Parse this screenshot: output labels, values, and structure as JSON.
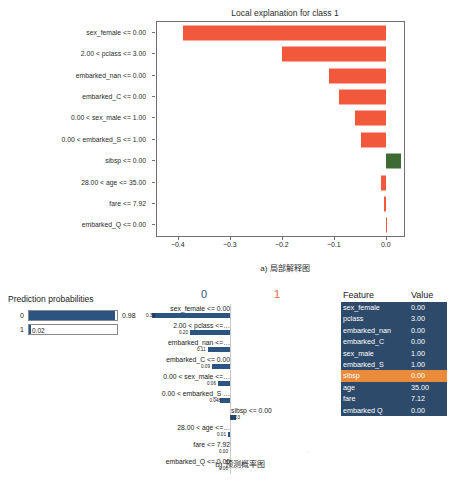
{
  "chart_data": [
    {
      "type": "bar",
      "orientation": "horizontal",
      "title": "Local explanation for class 1",
      "xlabel": "",
      "ylabel": "",
      "xlim": [
        -0.44,
        0.035
      ],
      "xticks": [
        -0.4,
        -0.3,
        -0.2,
        -0.1,
        0.0
      ],
      "xtick_labels": [
        "−0.4",
        "−0.3",
        "−0.2",
        "−0.1",
        "0.0"
      ],
      "grid": false,
      "legend": "none",
      "categories": [
        "sex_female <= 0.00",
        "2.00 < pclass <= 3.00",
        "embarked_nan <= 0.00",
        "embarked_C <= 0.00",
        "0.00 < sex_male <= 1.00",
        "0.00 < embarked_S <= 1.00",
        "sibsp <= 0.00",
        "28.00 < age <= 35.00",
        "fare <= 7.92",
        "embarked_Q <= 0.00"
      ],
      "values": [
        -0.39,
        -0.2,
        -0.11,
        -0.09,
        -0.06,
        -0.048,
        0.03,
        -0.01,
        -0.004,
        -0.0005
      ],
      "colors": {
        "negative": "#f2593c",
        "positive": "#3e6b34"
      },
      "caption": "a) 局部解释图"
    },
    {
      "type": "bar",
      "orientation": "horizontal",
      "title": "",
      "class_labels": [
        "0",
        "1"
      ],
      "class_label_colors": [
        "#2b5481",
        "#e06a4a"
      ],
      "grid": false,
      "legend": "none",
      "categories": [
        "sex_female <= 0.00",
        "2.00 < pclass <=…",
        "embarked_nan <=…",
        "embarked_C <= 0.00",
        "0.00 < sex_male <=…",
        "0.00 < embarked_S …",
        "sibsp <= 0.00",
        "28.00 < age <=…",
        "fare <= 7.92",
        "embarked_Q <= 0.00"
      ],
      "values": [
        0.39,
        0.2,
        0.11,
        0.09,
        0.06,
        0.048,
        0.03,
        0.01,
        0.0,
        0.0
      ],
      "value_labels": [
        "0.39",
        "0.20",
        "0.11",
        "0.09",
        "0.06",
        "0.048",
        "0.03",
        "0.01",
        "0.00",
        "0.00"
      ],
      "side": [
        "left",
        "left",
        "left",
        "left",
        "left",
        "left",
        "right",
        "left",
        "left",
        "left"
      ],
      "color": "#2b5481",
      "caption": "b) 预测概率图"
    }
  ],
  "panel_a": {
    "title": "Local explanation for class 1",
    "caption": "a) 局部解释图",
    "y_labels": [
      "sex_female <= 0.00",
      "2.00 < pclass <= 3.00",
      "embarked_nan <= 0.00",
      "embarked_C <= 0.00",
      "0.00 < sex_male <= 1.00",
      "0.00 < embarked_S <= 1.00",
      "sibsp <= 0.00",
      "28.00 < age <= 35.00",
      "fare <= 7.92",
      "embarked_Q <= 0.00"
    ],
    "x_labels": [
      "−0.4",
      "−0.3",
      "−0.2",
      "−0.1",
      "0.0"
    ]
  },
  "panel_b": {
    "caption": "b) 预测概率图",
    "prediction": {
      "title": "Prediction probabilities",
      "rows": [
        {
          "key": "0",
          "value": "0.98",
          "fraction": 0.98,
          "inside": false
        },
        {
          "key": "1",
          "value": "0.02",
          "fraction": 0.02,
          "inside": true
        }
      ]
    },
    "mini_chart": {
      "class_0": "0",
      "class_1": "1",
      "rows": [
        {
          "label": "sex_female <= 0.00",
          "value": "0.39",
          "side": "left"
        },
        {
          "label": "2.00 < pclass <=…",
          "value": "0.20",
          "side": "left"
        },
        {
          "label": "embarked_nan <=…",
          "value": "0.11",
          "side": "left"
        },
        {
          "label": "embarked_C <= 0.00",
          "value": "0.09",
          "side": "left"
        },
        {
          "label": "0.00 < sex_male <=…",
          "value": "0.06",
          "side": "left"
        },
        {
          "label": "0.00 < embarked_S …",
          "value": "0.048",
          "side": "left"
        },
        {
          "label": "sibsp <= 0.00",
          "value": "0.03",
          "side": "right"
        },
        {
          "label": "28.00 < age <=…",
          "value": "0.01",
          "side": "left"
        },
        {
          "label": "fare <= 7.92",
          "value": "0.00",
          "side": "left"
        },
        {
          "label": "embarked_Q <= 0.00",
          "value": "0.00",
          "side": "left"
        }
      ]
    },
    "feature_table": {
      "headers": {
        "feature": "Feature",
        "value": "Value"
      },
      "highlight_color": "#e98b3a",
      "rows": [
        {
          "feature": "sex_female",
          "value": "0.00",
          "highlight": false
        },
        {
          "feature": "pclass",
          "value": "3.00",
          "highlight": false
        },
        {
          "feature": "embarked_nan",
          "value": "0.00",
          "highlight": false
        },
        {
          "feature": "embarked_C",
          "value": "0.00",
          "highlight": false
        },
        {
          "feature": "sex_male",
          "value": "1.00",
          "highlight": false
        },
        {
          "feature": "embarked_S",
          "value": "1.00",
          "highlight": false
        },
        {
          "feature": "sibsp",
          "value": "0.00",
          "highlight": true
        },
        {
          "feature": "age",
          "value": "35.00",
          "highlight": false
        },
        {
          "feature": "fare",
          "value": "7.12",
          "highlight": false
        },
        {
          "feature": "embarked Q",
          "value": "0.00",
          "highlight": false
        }
      ]
    }
  }
}
